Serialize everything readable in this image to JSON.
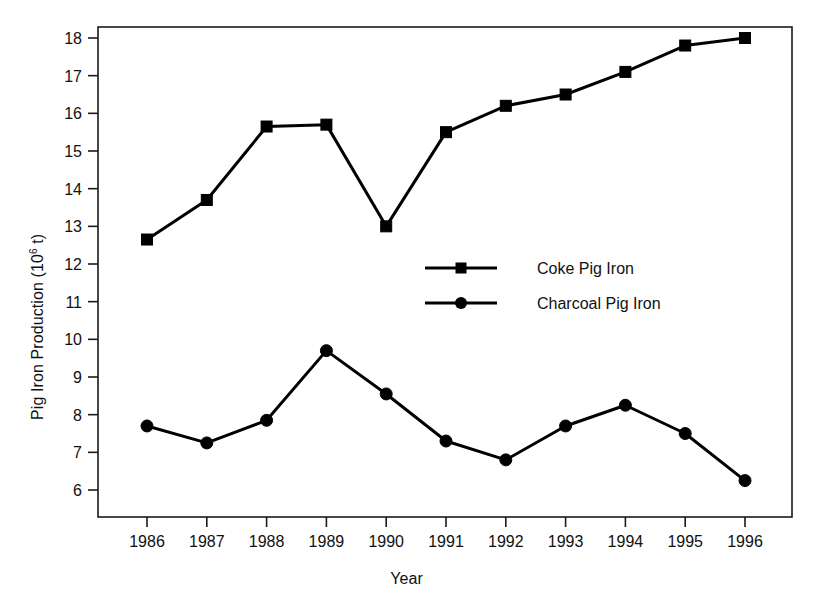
{
  "chart_data": {
    "type": "line",
    "title": "",
    "xlabel": "Year",
    "ylabel": "Pig Iron Production (10^6 t)",
    "ylabel_base": "Pig Iron Production (10",
    "ylabel_exponent": "6",
    "ylabel_tail": " t)",
    "categories": [
      "1986",
      "1987",
      "1988",
      "1989",
      "1990",
      "1991",
      "1992",
      "1993",
      "1994",
      "1995",
      "1996"
    ],
    "x": [
      1986,
      1987,
      1988,
      1989,
      1990,
      1991,
      1992,
      1993,
      1994,
      1995,
      1996
    ],
    "xlim": [
      1985.4,
      1996.8
    ],
    "ylim": [
      6,
      18.3
    ],
    "yticks": [
      6,
      7,
      8,
      9,
      10,
      11,
      12,
      13,
      14,
      15,
      16,
      17,
      18
    ],
    "ytick_labels": [
      "6",
      "7",
      "8",
      "9",
      "10",
      "11",
      "12",
      "13",
      "14",
      "15",
      "16",
      "17",
      "18"
    ],
    "grid": false,
    "legend_position": "center",
    "series": [
      {
        "name": "Coke Pig Iron",
        "marker": "square",
        "color": "#000000",
        "values": [
          12.65,
          13.7,
          15.65,
          15.7,
          13.0,
          15.5,
          16.2,
          16.5,
          17.1,
          17.8,
          18.0
        ]
      },
      {
        "name": "Charcoal Pig Iron",
        "marker": "circle",
        "color": "#000000",
        "values": [
          7.7,
          7.25,
          7.85,
          9.7,
          8.55,
          7.3,
          6.8,
          7.7,
          8.25,
          7.5,
          6.25
        ]
      }
    ]
  },
  "legend": {
    "items": [
      {
        "label": "Coke Pig Iron",
        "marker": "square"
      },
      {
        "label": "Charcoal Pig Iron",
        "marker": "circle"
      }
    ]
  },
  "axes": {
    "x_title": "Year",
    "y_title_base": "Pig Iron Production (10",
    "y_title_exponent": "6",
    "y_title_tail": " t)"
  }
}
